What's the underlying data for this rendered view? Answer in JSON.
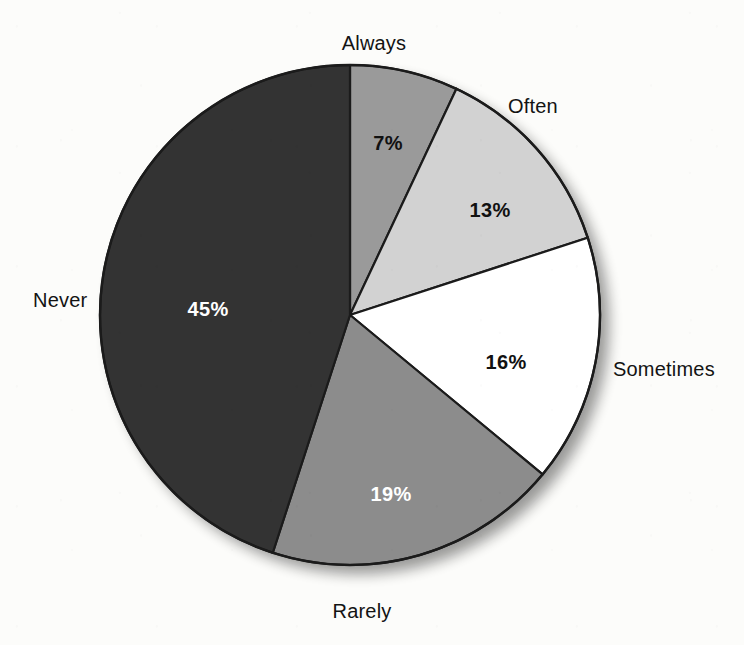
{
  "chart_data": {
    "type": "pie",
    "title": "",
    "categories": [
      "Always",
      "Often",
      "Sometimes",
      "Rarely",
      "Never"
    ],
    "values": [
      7,
      13,
      16,
      19,
      45
    ],
    "value_labels": [
      "7%",
      "13%",
      "16%",
      "19%",
      "45%"
    ],
    "unit": "percent",
    "start_angle_deg": 0,
    "direction": "clockwise",
    "legend": "none",
    "grid": false,
    "colors": [
      "#9a9a9a",
      "#d2d2d2",
      "#ffffff",
      "#8c8c8c",
      "#333333"
    ],
    "label_text_colors": [
      "#111111",
      "#111111",
      "#111111",
      "#ffffff",
      "#ffffff"
    ],
    "slices": [
      {
        "name": "Always",
        "value": 7,
        "value_label": "7%",
        "color": "#9a9a9a",
        "label_color": "#111111"
      },
      {
        "name": "Often",
        "value": 13,
        "value_label": "13%",
        "color": "#d2d2d2",
        "label_color": "#111111"
      },
      {
        "name": "Sometimes",
        "value": 16,
        "value_label": "16%",
        "color": "#ffffff",
        "label_color": "#111111"
      },
      {
        "name": "Rarely",
        "value": 19,
        "value_label": "19%",
        "color": "#8c8c8c",
        "label_color": "#ffffff"
      },
      {
        "name": "Never",
        "value": 45,
        "value_label": "45%",
        "color": "#333333",
        "label_color": "#ffffff"
      }
    ]
  },
  "labels": {
    "always": "Always",
    "often": "Often",
    "sometimes": "Sometimes",
    "rarely": "Rarely",
    "never": "Never"
  },
  "values": {
    "always": "7%",
    "often": "13%",
    "sometimes": "16%",
    "rarely": "19%",
    "never": "45%"
  },
  "style": {
    "background": "#fcfcfa",
    "outline": "#1b1b1b",
    "shadow": "rgba(0,0,0,0.35)"
  }
}
